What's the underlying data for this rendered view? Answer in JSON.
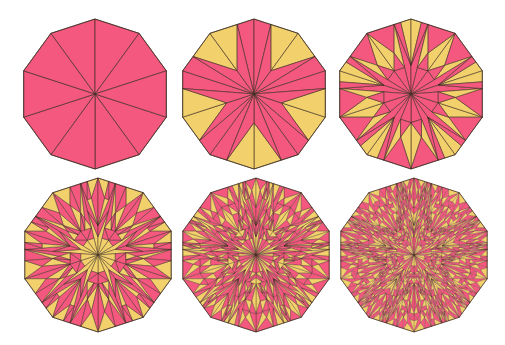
{
  "document": {
    "title": "Decagonal substitution tiling iterations",
    "background_color": "#ffffff",
    "width": 505,
    "height": 345
  },
  "palette": {
    "tile_a_fill": "#f2d06b",
    "tile_b_fill": "#f4587e",
    "stroke": "#3b2b20",
    "background": "#ffffff"
  },
  "figure": {
    "kind": "substitution-tiling-series",
    "shape": "regular decagon",
    "sides": 10,
    "iterations_shown": 6,
    "columns": 3,
    "rows": 2,
    "inflation_ratio": 1.618033988749895
  },
  "panels": [
    {
      "id": "panel-1",
      "iteration": 0,
      "label": "iteration 0",
      "depth": 0,
      "cx": 95,
      "cy": 94,
      "radius": 75,
      "rotation": 18
    },
    {
      "id": "panel-2",
      "iteration": 1,
      "label": "iteration 1",
      "depth": 1,
      "cx": 254,
      "cy": 94,
      "radius": 75,
      "rotation": 18
    },
    {
      "id": "panel-3",
      "iteration": 2,
      "label": "iteration 2",
      "depth": 2,
      "cx": 411,
      "cy": 94,
      "radius": 75,
      "rotation": 18
    },
    {
      "id": "panel-4",
      "iteration": 3,
      "label": "iteration 3",
      "depth": 3,
      "cx": 98,
      "cy": 255,
      "radius": 77,
      "rotation": 18
    },
    {
      "id": "panel-5",
      "iteration": 4,
      "label": "iteration 4",
      "depth": 4,
      "cx": 256,
      "cy": 255,
      "radius": 77,
      "rotation": 18
    },
    {
      "id": "panel-6",
      "iteration": 5,
      "label": "iteration 5",
      "depth": 5,
      "cx": 414,
      "cy": 255,
      "radius": 77,
      "rotation": 18
    }
  ],
  "stroke_widths": [
    0.65,
    0.6,
    0.55,
    0.45,
    0.33,
    0.22
  ],
  "chart_data": {
    "type": "diagram",
    "series": [
      {
        "name": "iteration",
        "values": [
          0,
          1,
          2,
          3,
          4,
          5
        ]
      },
      {
        "name": "approx_tile_count",
        "values": [
          10,
          30,
          90,
          250,
          680,
          1800
        ]
      }
    ],
    "categories": [
      "0",
      "1",
      "2",
      "3",
      "4",
      "5"
    ],
    "legend": [
      {
        "label": "tile A (acute / yellow)",
        "color": "#f2d06b"
      },
      {
        "label": "tile B (obtuse / pink)",
        "color": "#f4587e"
      }
    ],
    "legend_position": "none",
    "grid": false
  }
}
